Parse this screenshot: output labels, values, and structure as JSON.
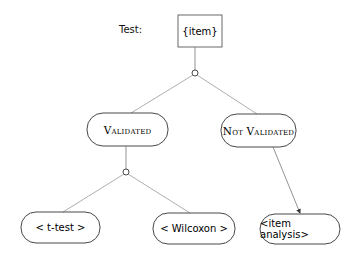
{
  "diagram": {
    "test_label": "Test:",
    "root": {
      "label": "{item}"
    },
    "branches": [
      {
        "label": "Validated",
        "children": [
          {
            "label": "< t-test >"
          },
          {
            "label": "< Wilcoxon >"
          }
        ]
      },
      {
        "label": "Not Validated",
        "children": [
          {
            "label": "<item analysis>"
          }
        ]
      }
    ],
    "colors": {
      "stroke": "#222222",
      "edge": "#888888",
      "background": "#ffffff"
    }
  }
}
